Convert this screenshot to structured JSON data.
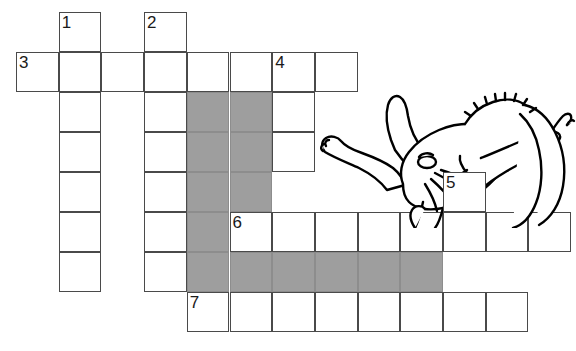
{
  "page": {
    "background_color": "#ffffff",
    "width": 576,
    "height": 351
  },
  "grid": {
    "cell_width": 42.7,
    "cell_height": 40,
    "origin_x": 16,
    "origin_y": 12,
    "rows": 8,
    "cols": 13,
    "line_color": "#4a4a4a",
    "cell_color": "#ffffff",
    "block_color": "#9e9e9e"
  },
  "clue_numbers": [
    {
      "number": "1",
      "row": 0,
      "col": 1
    },
    {
      "number": "2",
      "row": 0,
      "col": 3
    },
    {
      "number": "3",
      "row": 1,
      "col": 0
    },
    {
      "number": "4",
      "row": 1,
      "col": 6
    },
    {
      "number": "5",
      "row": 4,
      "col": 10
    },
    {
      "number": "6",
      "row": 5,
      "col": 5
    },
    {
      "number": "7",
      "row": 7,
      "col": 4
    }
  ],
  "cells": [
    {
      "row": 0,
      "col": 1,
      "type": "open",
      "number": "1"
    },
    {
      "row": 0,
      "col": 3,
      "type": "open",
      "number": "2"
    },
    {
      "row": 1,
      "col": 0,
      "type": "open",
      "number": "3"
    },
    {
      "row": 1,
      "col": 1,
      "type": "open",
      "number": ""
    },
    {
      "row": 1,
      "col": 2,
      "type": "open",
      "number": ""
    },
    {
      "row": 1,
      "col": 3,
      "type": "open",
      "number": ""
    },
    {
      "row": 1,
      "col": 4,
      "type": "open",
      "number": ""
    },
    {
      "row": 1,
      "col": 5,
      "type": "open",
      "number": ""
    },
    {
      "row": 1,
      "col": 6,
      "type": "open",
      "number": "4"
    },
    {
      "row": 1,
      "col": 7,
      "type": "open",
      "number": ""
    },
    {
      "row": 2,
      "col": 1,
      "type": "open",
      "number": ""
    },
    {
      "row": 2,
      "col": 3,
      "type": "open",
      "number": ""
    },
    {
      "row": 2,
      "col": 4,
      "type": "block",
      "number": ""
    },
    {
      "row": 2,
      "col": 5,
      "type": "block",
      "number": ""
    },
    {
      "row": 2,
      "col": 6,
      "type": "open",
      "number": ""
    },
    {
      "row": 3,
      "col": 1,
      "type": "open",
      "number": ""
    },
    {
      "row": 3,
      "col": 3,
      "type": "open",
      "number": ""
    },
    {
      "row": 3,
      "col": 4,
      "type": "block",
      "number": ""
    },
    {
      "row": 3,
      "col": 5,
      "type": "block",
      "number": ""
    },
    {
      "row": 3,
      "col": 6,
      "type": "open",
      "number": ""
    },
    {
      "row": 4,
      "col": 1,
      "type": "open",
      "number": ""
    },
    {
      "row": 4,
      "col": 3,
      "type": "open",
      "number": ""
    },
    {
      "row": 4,
      "col": 4,
      "type": "block",
      "number": ""
    },
    {
      "row": 4,
      "col": 5,
      "type": "block",
      "number": ""
    },
    {
      "row": 4,
      "col": 10,
      "type": "open",
      "number": "5"
    },
    {
      "row": 5,
      "col": 1,
      "type": "open",
      "number": ""
    },
    {
      "row": 5,
      "col": 3,
      "type": "open",
      "number": ""
    },
    {
      "row": 5,
      "col": 4,
      "type": "block",
      "number": ""
    },
    {
      "row": 5,
      "col": 5,
      "type": "open",
      "number": "6"
    },
    {
      "row": 5,
      "col": 6,
      "type": "open",
      "number": ""
    },
    {
      "row": 5,
      "col": 7,
      "type": "open",
      "number": ""
    },
    {
      "row": 5,
      "col": 8,
      "type": "open",
      "number": ""
    },
    {
      "row": 5,
      "col": 9,
      "type": "open",
      "number": ""
    },
    {
      "row": 5,
      "col": 10,
      "type": "open",
      "number": ""
    },
    {
      "row": 5,
      "col": 11,
      "type": "open",
      "number": ""
    },
    {
      "row": 5,
      "col": 12,
      "type": "open",
      "number": ""
    },
    {
      "row": 6,
      "col": 1,
      "type": "open",
      "number": ""
    },
    {
      "row": 6,
      "col": 3,
      "type": "open",
      "number": ""
    },
    {
      "row": 6,
      "col": 4,
      "type": "block",
      "number": ""
    },
    {
      "row": 6,
      "col": 5,
      "type": "block",
      "number": ""
    },
    {
      "row": 6,
      "col": 6,
      "type": "block",
      "number": ""
    },
    {
      "row": 6,
      "col": 7,
      "type": "block",
      "number": ""
    },
    {
      "row": 6,
      "col": 8,
      "type": "block",
      "number": ""
    },
    {
      "row": 6,
      "col": 9,
      "type": "block",
      "number": ""
    },
    {
      "row": 7,
      "col": 4,
      "type": "open",
      "number": "7"
    },
    {
      "row": 7,
      "col": 5,
      "type": "open",
      "number": ""
    },
    {
      "row": 7,
      "col": 6,
      "type": "open",
      "number": ""
    },
    {
      "row": 7,
      "col": 7,
      "type": "open",
      "number": ""
    },
    {
      "row": 7,
      "col": 8,
      "type": "open",
      "number": ""
    },
    {
      "row": 7,
      "col": 9,
      "type": "open",
      "number": ""
    },
    {
      "row": 7,
      "col": 10,
      "type": "open",
      "number": ""
    },
    {
      "row": 7,
      "col": 11,
      "type": "open",
      "number": ""
    }
  ],
  "illustration": {
    "name": "elephant-line-drawing",
    "description": "Black-and-white line drawing of an elephant lying on its back with legs up, trunk and ear visible",
    "stroke_color": "#000000",
    "fill_color": "#ffffff"
  }
}
